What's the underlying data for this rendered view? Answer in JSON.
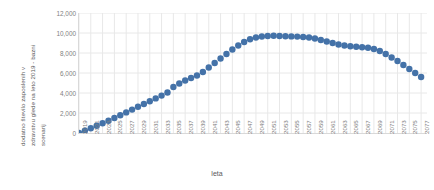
{
  "chart_data": {
    "type": "scatter",
    "title": "",
    "xlabel": "leta",
    "ylabel": "dodatno število zaposlenih v zdravstvu glede na leto 2019 - bazni scenarij",
    "ylabel_lines": [
      "dodatno število zaposlenih v",
      "zdravstvu glede na leto 2019 - bazni",
      "scenarij"
    ],
    "series_color": "#4472a8",
    "grid": true,
    "grid_color": "#e8e8e8",
    "legend": "none",
    "xlim": [
      2019,
      2078
    ],
    "ylim": [
      0,
      12000
    ],
    "yticks": [
      0,
      2000,
      4000,
      6000,
      8000,
      10000,
      12000
    ],
    "ytick_labels": [
      "0",
      "2,000",
      "4,000",
      "6,000",
      "8,000",
      "10,000",
      "12,000"
    ],
    "xticks": [
      2019,
      2021,
      2023,
      2025,
      2027,
      2029,
      2031,
      2033,
      2035,
      2037,
      2039,
      2041,
      2043,
      2045,
      2047,
      2049,
      2051,
      2053,
      2055,
      2057,
      2059,
      2061,
      2063,
      2065,
      2067,
      2069,
      2071,
      2073,
      2075,
      2077
    ],
    "xtick_labels": [
      "2019",
      "2021",
      "2023",
      "2025",
      "2027",
      "2029",
      "2031",
      "2033",
      "2035",
      "2037",
      "2039",
      "2041",
      "2043",
      "2045",
      "2047",
      "2049",
      "2051",
      "2053",
      "2055",
      "2057",
      "2059",
      "2061",
      "2063",
      "2065",
      "2067",
      "2069",
      "2071",
      "2073",
      "2075",
      "2077"
    ],
    "x": [
      2019,
      2020,
      2021,
      2022,
      2023,
      2024,
      2025,
      2026,
      2027,
      2028,
      2029,
      2030,
      2031,
      2032,
      2033,
      2034,
      2035,
      2036,
      2037,
      2038,
      2039,
      2040,
      2041,
      2042,
      2043,
      2044,
      2045,
      2046,
      2047,
      2048,
      2049,
      2050,
      2051,
      2052,
      2053,
      2054,
      2055,
      2056,
      2057,
      2058,
      2059,
      2060,
      2061,
      2062,
      2063,
      2064,
      2065,
      2066,
      2067,
      2068,
      2069,
      2070,
      2071,
      2072,
      2073,
      2074,
      2075,
      2076,
      2077
    ],
    "values": [
      0,
      230,
      480,
      730,
      980,
      1230,
      1500,
      1780,
      2060,
      2340,
      2620,
      2900,
      3180,
      3460,
      3740,
      4050,
      4600,
      4950,
      5250,
      5500,
      5750,
      6100,
      6550,
      7000,
      7450,
      7900,
      8350,
      8750,
      9100,
      9380,
      9550,
      9650,
      9700,
      9720,
      9700,
      9680,
      9660,
      9640,
      9600,
      9550,
      9450,
      9300,
      9150,
      9000,
      8850,
      8750,
      8680,
      8620,
      8570,
      8520,
      8400,
      8200,
      7900,
      7550,
      7200,
      6800,
      6400,
      6000,
      5600
    ],
    "marker_size": 4.2
  }
}
